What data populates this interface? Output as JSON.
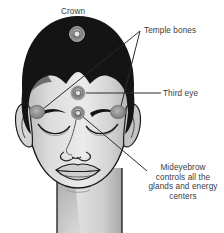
{
  "figure": {
    "background_color": "#ffffff",
    "text_color": "#3b3b3b"
  },
  "labels": {
    "crown": "Crown",
    "temple_bones": "Temple bones",
    "third_eye": "Third eye",
    "mideyebrow_caption": [
      "Mideyebrow",
      "controls all the",
      "glands and energy",
      "centers"
    ]
  },
  "markers": {
    "crown": {
      "name": "crown-point",
      "x": 77,
      "y": 34,
      "r": 7.5,
      "color": "#8a8a8a"
    },
    "third_eye": {
      "name": "third-eye-point",
      "x": 78,
      "y": 93,
      "r": 7.0,
      "color": "#8a8a8a"
    },
    "mideyebrow": {
      "name": "mideyebrow-point",
      "x": 78,
      "y": 113,
      "r": 6.5,
      "color": "#8a8a8a"
    },
    "temple_left": {
      "name": "temple-bone-left-point",
      "x": 37,
      "y": 112,
      "r": 7.0,
      "color": "#8a8a8a"
    },
    "temple_right": {
      "name": "temple-bone-right-point",
      "x": 118,
      "y": 112,
      "r": 7.0,
      "color": "#8a8a8a"
    }
  },
  "colors": {
    "hair": "#141414",
    "skin_light": "#e3e3e3",
    "skin_shadow": "#b4b4b4",
    "outline": "#1a1a1a",
    "marker": "#8a8a8a",
    "marker_core": "#d8d8d8",
    "leader_line": "#2a2a2a"
  },
  "leader_lines": [
    {
      "name": "temple-bones-to-left-temple",
      "from": [
        140,
        31
      ],
      "to": [
        42,
        109
      ]
    },
    {
      "name": "temple-bones-to-right-temple",
      "from": [
        140,
        31
      ],
      "to": [
        120,
        106
      ]
    },
    {
      "name": "third-eye-to-marker",
      "from": [
        160,
        93
      ],
      "to": [
        85,
        93
      ]
    },
    {
      "name": "mideyebrow-to-marker",
      "from": [
        146,
        171
      ],
      "to": [
        81,
        115
      ]
    }
  ]
}
